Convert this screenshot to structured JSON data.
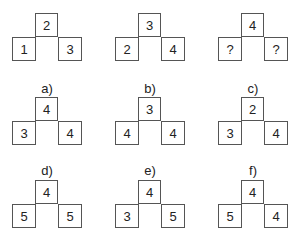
{
  "examples": [
    {
      "top": "2",
      "left": "1",
      "right": "3"
    },
    {
      "top": "3",
      "left": "2",
      "right": "4"
    },
    {
      "top": "4",
      "left": "?",
      "right": "?"
    }
  ],
  "options": [
    {
      "label": "a)",
      "top": "4",
      "left": "3",
      "right": "4"
    },
    {
      "label": "b)",
      "top": "3",
      "left": "4",
      "right": "4"
    },
    {
      "label": "c)",
      "top": "2",
      "left": "3",
      "right": "4"
    },
    {
      "label": "d)",
      "top": "4",
      "left": "5",
      "right": "5"
    },
    {
      "label": "e)",
      "top": "4",
      "left": "3",
      "right": "5"
    },
    {
      "label": "f)",
      "top": "4",
      "left": "5",
      "right": "4"
    }
  ]
}
